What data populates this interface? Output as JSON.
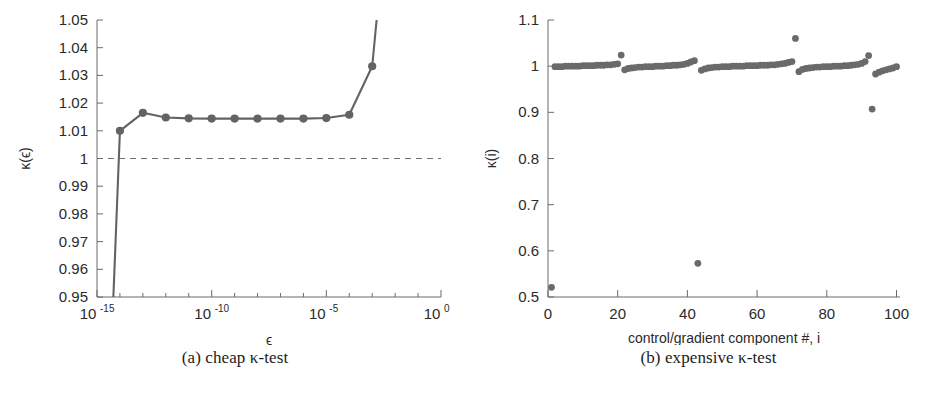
{
  "figure": {
    "panels": [
      {
        "id": "a",
        "caption": "(a) cheap κ-test"
      },
      {
        "id": "b",
        "caption": "(b) expensive κ-test"
      }
    ],
    "colors": {
      "line": "#636363",
      "marker": "#636363",
      "scatter": "#6a6a6a",
      "axis": "#6b6b6b",
      "reference": "#6f6f6f",
      "background": "#ffffff",
      "text": "#2a2a2a"
    }
  },
  "chart_data": [
    {
      "type": "line",
      "panel": "a",
      "title": "",
      "caption": "(a) cheap κ-test",
      "xlabel": "ϵ",
      "ylabel": "κ(ϵ)",
      "xscale": "log",
      "yscale": "linear",
      "xlim": [
        1e-15,
        1
      ],
      "ylim": [
        0.95,
        1.05
      ],
      "grid": false,
      "legend": "none",
      "xticks": [
        1e-15,
        1e-10,
        1e-05,
        1
      ],
      "xtick_labels": [
        "10^-15",
        "10^-10",
        "10^-5",
        "10^0"
      ],
      "xtick_bases": [
        "10",
        "10",
        "10",
        "10"
      ],
      "xtick_exponents": [
        "-15",
        "-10",
        "-5",
        "0"
      ],
      "xminor_ticks": [
        1e-14,
        1e-13,
        1e-12,
        1e-11,
        1e-09,
        1e-08,
        1e-07,
        1e-06,
        0.0001,
        0.001,
        0.01,
        0.1
      ],
      "yticks": [
        0.95,
        0.96,
        0.97,
        0.98,
        0.99,
        1.0,
        1.01,
        1.02,
        1.03,
        1.04,
        1.05
      ],
      "ytick_labels": [
        "0.95",
        "0.96",
        "0.97",
        "0.98",
        "0.99",
        "1",
        "1.01",
        "1.02",
        "1.03",
        "1.04",
        "1.05"
      ],
      "reference_lines": [
        {
          "orientation": "horizontal",
          "value": 1.0,
          "style": "dashed"
        }
      ],
      "x": [
        1e-16,
        1e-15,
        1e-14,
        1e-13,
        1e-12,
        1e-11,
        1e-10,
        1e-09,
        1e-08,
        1e-07,
        1e-06,
        1e-05,
        0.0001,
        0.001,
        0.01
      ],
      "y": [
        1.22,
        0.8,
        1.01,
        1.0165,
        1.0148,
        1.0145,
        1.0144,
        1.0144,
        1.0144,
        1.0144,
        1.0144,
        1.0146,
        1.0158,
        1.0333,
        1.12
      ],
      "markers_visible_from_index": 2,
      "series_note": "first two points run off-scale producing two near-vertical segments at the left edge"
    },
    {
      "type": "scatter",
      "panel": "b",
      "title": "",
      "caption": "(b) expensive κ-test",
      "xlabel": "control/gradient component #, i",
      "ylabel": "κ(i)",
      "xscale": "linear",
      "yscale": "linear",
      "xlim": [
        0,
        101
      ],
      "ylim": [
        0.5,
        1.1
      ],
      "grid": false,
      "legend": "none",
      "xticks": [
        0,
        20,
        40,
        60,
        80,
        100
      ],
      "xtick_labels": [
        "0",
        "20",
        "40",
        "60",
        "80",
        "100"
      ],
      "yticks": [
        0.5,
        0.6,
        0.7,
        0.8,
        0.9,
        1.0,
        1.1
      ],
      "ytick_labels": [
        "0.5",
        "0.6",
        "0.7",
        "0.8",
        "0.9",
        "1",
        "1.1"
      ],
      "x": [
        1,
        2,
        3,
        4,
        5,
        6,
        7,
        8,
        9,
        10,
        11,
        12,
        13,
        14,
        15,
        16,
        17,
        18,
        19,
        20,
        21,
        22,
        23,
        24,
        25,
        26,
        27,
        28,
        29,
        30,
        31,
        32,
        33,
        34,
        35,
        36,
        37,
        38,
        39,
        40,
        41,
        42,
        43,
        44,
        45,
        46,
        47,
        48,
        49,
        50,
        51,
        52,
        53,
        54,
        55,
        56,
        57,
        58,
        59,
        60,
        61,
        62,
        63,
        64,
        65,
        66,
        67,
        68,
        69,
        70,
        71,
        72,
        73,
        74,
        75,
        76,
        77,
        78,
        79,
        80,
        81,
        82,
        83,
        84,
        85,
        86,
        87,
        88,
        89,
        90,
        91,
        92,
        93,
        94,
        95,
        96,
        97,
        98,
        99,
        100
      ],
      "y": [
        0.521,
        0.999,
        0.999,
        0.999,
        1.0,
        1.0,
        1.0,
        1.0,
        1.0,
        1.001,
        1.001,
        1.001,
        1.001,
        1.002,
        1.002,
        1.002,
        1.003,
        1.003,
        1.004,
        1.005,
        1.024,
        0.992,
        0.995,
        0.996,
        0.997,
        0.998,
        0.998,
        0.999,
        0.999,
        0.999,
        1.0,
        1.0,
        1.0,
        1.001,
        1.001,
        1.002,
        1.002,
        1.003,
        1.004,
        1.006,
        1.009,
        1.012,
        0.573,
        0.991,
        0.994,
        0.996,
        0.997,
        0.998,
        0.998,
        0.999,
        0.999,
        0.999,
        1.0,
        1.0,
        1.0,
        1.0,
        1.001,
        1.001,
        1.001,
        1.001,
        1.002,
        1.002,
        1.002,
        1.003,
        1.003,
        1.004,
        1.005,
        1.006,
        1.008,
        1.01,
        1.06,
        0.988,
        0.993,
        0.995,
        0.996,
        0.997,
        0.998,
        0.998,
        0.999,
        0.999,
        0.999,
        1.0,
        1.0,
        1.0,
        1.001,
        1.001,
        1.002,
        1.003,
        1.004,
        1.006,
        1.01,
        1.023,
        0.907,
        0.983,
        0.987,
        0.99,
        0.992,
        0.994,
        0.996,
        0.999
      ],
      "annotations": [
        {
          "label": "low outlier",
          "x": 1,
          "y": 0.521
        },
        {
          "label": "low outlier",
          "x": 43,
          "y": 0.573
        },
        {
          "label": "high outlier",
          "x": 72,
          "y": 1.06
        },
        {
          "label": "low outlier",
          "x": 93,
          "y": 0.907
        }
      ],
      "series_note": "five ramp segments of ~20 components each; each segment rises slowly toward 1 then drops at the next segment start"
    }
  ]
}
